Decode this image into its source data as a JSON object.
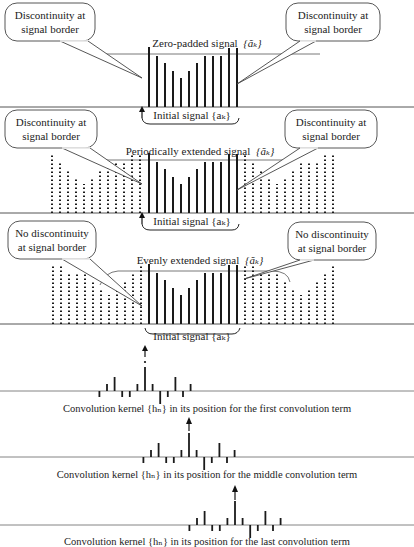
{
  "signal": {
    "heights": [
      60,
      51,
      44,
      36,
      29,
      36,
      44,
      51,
      51,
      51,
      59,
      59
    ],
    "spacing": 8,
    "first_x": 149
  },
  "panels": [
    {
      "id": "zero-padded",
      "title": "Zero-padded signal {ãₖ}",
      "title_text": "Zero-padded signal",
      "title_math": "{ãₖ}",
      "bracket_label": "Initial signal {aₖ}",
      "callout_left": [
        "Discontinuity at",
        "signal border"
      ],
      "callout_right": [
        "Discontinuity at",
        "signal border"
      ],
      "baseline_y": 107
    },
    {
      "id": "periodic",
      "title_text": "Periodically extended signal",
      "title_math": "{ãₖ}",
      "bracket_label": "Initial signal {aₖ}",
      "callout_left": [
        "Discontinuity at",
        "signal border"
      ],
      "callout_right": [
        "Discontinuity at",
        "signal border"
      ],
      "baseline_y": 213
    },
    {
      "id": "even",
      "title_text": "Evenly extended signal",
      "title_math": "{ãₖ}",
      "bracket_label": "Initial signal {aₖ}",
      "callout_left": [
        "No discontinuity",
        "at signal border"
      ],
      "callout_right": [
        "No discontinuity",
        "at signal border"
      ],
      "baseline_y": 324
    }
  ],
  "kernels": [
    {
      "id": "first",
      "caption": "Convolution kernel {hₙ} in its position for the first convolution term",
      "baseline_y": 391,
      "center_x": 145
    },
    {
      "id": "middle",
      "caption": "Convolution kernel {hₙ} in its position for the middle convolution term",
      "baseline_y": 457,
      "center_x": 189
    },
    {
      "id": "last",
      "caption": "Convolution kernel {hₙ} in its position for the last convolution term",
      "baseline_y": 525,
      "center_x": 235
    }
  ],
  "kernel_taps": [
    -6,
    7,
    14,
    -6,
    -6,
    7,
    24,
    7,
    -13,
    -6,
    14,
    -6,
    7
  ],
  "colors": {
    "ink": "#1a1a1a",
    "axis": "#555555",
    "background": "#ffffff"
  }
}
